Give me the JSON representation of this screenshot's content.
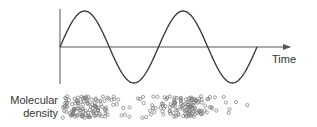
{
  "diagram": {
    "axis_label_x": "Time",
    "density_label_line1": "Molecular",
    "density_label_line2": "density",
    "colors": {
      "axis": "#555555",
      "wave": "#333333",
      "molecule": "#777777",
      "text": "#333333"
    },
    "wave": {
      "type": "sine",
      "cycles": 2,
      "start_phase": "zero-crossing rising",
      "x_start": 60,
      "x_end": 257,
      "baseline_y": 47,
      "amplitude": 36
    },
    "molecules": {
      "description": "row of small circles, clustered (compressions) under wave crests and sparse (rarefactions) under troughs",
      "x_start": 62,
      "x_end": 252,
      "y_top": 96,
      "y_bottom": 118,
      "radius": 1.6
    }
  }
}
